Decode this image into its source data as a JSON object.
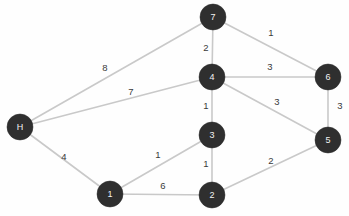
{
  "chart_data": {
    "type": "diagram",
    "title": "",
    "subtitle": "",
    "graph_kind": "undirected weighted graph",
    "colors": {
      "background": "#fefefe",
      "node_fill": "#2f2f2f",
      "node_text": "#f2f2f2",
      "edge_stroke": "#c9c9c9",
      "weight_text": "#3a3a3a"
    },
    "node_radius": 13,
    "nodes": [
      {
        "id": "H",
        "label": "H",
        "x": 20,
        "y": 127
      },
      {
        "id": "7",
        "label": "7",
        "x": 213,
        "y": 17
      },
      {
        "id": "4",
        "label": "4",
        "x": 212,
        "y": 77
      },
      {
        "id": "3",
        "label": "3",
        "x": 212,
        "y": 135
      },
      {
        "id": "1",
        "label": "1",
        "x": 110,
        "y": 194
      },
      {
        "id": "2",
        "label": "2",
        "x": 212,
        "y": 195
      },
      {
        "id": "6",
        "label": "6",
        "x": 328,
        "y": 77
      },
      {
        "id": "5",
        "label": "5",
        "x": 328,
        "y": 140
      }
    ],
    "edges": [
      {
        "source": "H",
        "target": "7",
        "weight": 8,
        "label": "8",
        "label_x": 105,
        "label_y": 68
      },
      {
        "source": "H",
        "target": "4",
        "weight": 7,
        "label": "7",
        "label_x": 131,
        "label_y": 92
      },
      {
        "source": "H",
        "target": "1",
        "weight": 4,
        "label": "4",
        "label_x": 64,
        "label_y": 157
      },
      {
        "source": "7",
        "target": "4",
        "weight": 2,
        "label": "2",
        "label_x": 206,
        "label_y": 48
      },
      {
        "source": "7",
        "target": "6",
        "weight": 1,
        "label": "1",
        "label_x": 271,
        "label_y": 33
      },
      {
        "source": "4",
        "target": "6",
        "weight": 3,
        "label": "3",
        "label_x": 270,
        "label_y": 67
      },
      {
        "source": "4",
        "target": "3",
        "weight": 1,
        "label": "1",
        "label_x": 206,
        "label_y": 106
      },
      {
        "source": "4",
        "target": "5",
        "weight": 3,
        "label": "3",
        "label_x": 277,
        "label_y": 102
      },
      {
        "source": "6",
        "target": "5",
        "weight": 3,
        "label": "3",
        "label_x": 340,
        "label_y": 106
      },
      {
        "source": "3",
        "target": "1",
        "weight": 1,
        "label": "1",
        "label_x": 158,
        "label_y": 155
      },
      {
        "source": "3",
        "target": "2",
        "weight": 1,
        "label": "1",
        "label_x": 206,
        "label_y": 164
      },
      {
        "source": "1",
        "target": "2",
        "weight": 6,
        "label": "6",
        "label_x": 163,
        "label_y": 186
      },
      {
        "source": "2",
        "target": "5",
        "weight": 2,
        "label": "2",
        "label_x": 271,
        "label_y": 161
      }
    ],
    "xlabel": "",
    "ylabel": "",
    "legend": [],
    "annotations": []
  }
}
